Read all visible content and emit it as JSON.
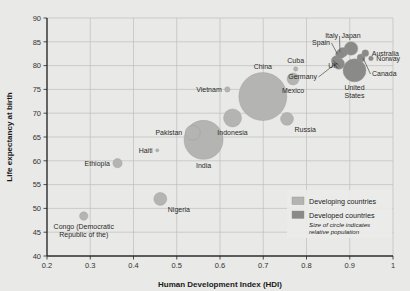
{
  "chart_data": {
    "type": "scatter",
    "title": "",
    "xlabel": "Human Development Index (HDI)",
    "ylabel": "Life expectancy at birth",
    "xlim": [
      0.2,
      1.0
    ],
    "ylim": [
      40,
      90
    ],
    "xticks": [
      "0.2",
      "0.3",
      "0.4",
      "0.5",
      "0.6",
      "0.7",
      "0.8",
      "0.9",
      "1"
    ],
    "yticks": [
      "40",
      "45",
      "50",
      "55",
      "60",
      "65",
      "70",
      "75",
      "80",
      "85",
      "90"
    ],
    "grid": true,
    "bubble_meaning": "Size of circle indicates relative population",
    "legend": {
      "position": "inside-bottom-right",
      "entries": [
        {
          "label": "Developing countries",
          "color": "#b4b4b2"
        },
        {
          "label": "Developed countries",
          "color": "#8a8a88"
        }
      ],
      "note_line1": "Size of circle indicates",
      "note_line2": "relative population"
    },
    "points": [
      {
        "name": "Congo (Democratic Republic of the)",
        "label_lines": [
          "Congo (Democratic",
          "Republic of the)"
        ],
        "x": 0.285,
        "y": 48.4,
        "r": 4.2,
        "group": "Developing countries",
        "label_pos": "below"
      },
      {
        "name": "Ethiopia",
        "label_lines": [
          "Ethiopia"
        ],
        "x": 0.363,
        "y": 59.5,
        "r": 4.6,
        "group": "Developing countries",
        "label_pos": "left"
      },
      {
        "name": "Haiti",
        "label_lines": [
          "Haiti"
        ],
        "x": 0.455,
        "y": 62.2,
        "r": 1.6,
        "group": "Developing countries",
        "label_pos": "left"
      },
      {
        "name": "Nigeria",
        "label_lines": [
          "Nigeria"
        ],
        "x": 0.462,
        "y": 52.0,
        "r": 6.5,
        "group": "Developing countries",
        "label_pos": "below-right"
      },
      {
        "name": "Pakistan",
        "label_lines": [
          "Pakistan"
        ],
        "x": 0.537,
        "y": 65.9,
        "r": 7.5,
        "group": "Developing countries",
        "label_pos": "left"
      },
      {
        "name": "India",
        "label_lines": [
          "India"
        ],
        "x": 0.562,
        "y": 64.4,
        "r": 19.5,
        "group": "Developing countries",
        "label_pos": "below"
      },
      {
        "name": "Indonesia",
        "label_lines": [
          "Indonesia"
        ],
        "x": 0.629,
        "y": 69.0,
        "r": 9.0,
        "group": "Developing countries",
        "label_pos": "below"
      },
      {
        "name": "Vietnam",
        "label_lines": [
          "Vietnam"
        ],
        "x": 0.617,
        "y": 75.0,
        "r": 2.6,
        "group": "Developing countries",
        "label_pos": "left"
      },
      {
        "name": "China",
        "label_lines": [
          "China"
        ],
        "x": 0.699,
        "y": 73.5,
        "r": 24.0,
        "group": "Developing countries",
        "label_pos": "above"
      },
      {
        "name": "Russia",
        "label_lines": [
          "Russia"
        ],
        "x": 0.755,
        "y": 68.8,
        "r": 6.4,
        "group": "Developing countries",
        "label_pos": "below-right"
      },
      {
        "name": "Mexico",
        "label_lines": [
          "Mexico"
        ],
        "x": 0.769,
        "y": 77.2,
        "r": 6.0,
        "group": "Developing countries",
        "label_pos": "below"
      },
      {
        "name": "Cuba",
        "label_lines": [
          "Cuba"
        ],
        "x": 0.775,
        "y": 79.3,
        "r": 2.2,
        "group": "Developing countries",
        "label_pos": "above"
      },
      {
        "name": "Germany",
        "label_lines": [
          "Germany"
        ],
        "x": 0.875,
        "y": 80.4,
        "r": 5.6,
        "group": "Developed countries",
        "label_pos": "leader-left"
      },
      {
        "name": "UK",
        "label_lines": [
          "UK"
        ],
        "x": 0.869,
        "y": 81.0,
        "r": 5.0,
        "group": "Developed countries",
        "label_pos": "leader-left"
      },
      {
        "name": "Spain",
        "label_lines": [
          "Spain"
        ],
        "x": 0.878,
        "y": 82.4,
        "r": 4.6,
        "group": "Developed countries",
        "label_pos": "leader-left"
      },
      {
        "name": "Italy",
        "label_lines": [
          "Italy"
        ],
        "x": 0.884,
        "y": 82.8,
        "r": 4.8,
        "group": "Developed countries",
        "label_pos": "leader-left"
      },
      {
        "name": "Japan",
        "label_lines": [
          "Japan"
        ],
        "x": 0.903,
        "y": 83.6,
        "r": 6.8,
        "group": "Developed countries",
        "label_pos": "above"
      },
      {
        "name": "Australia",
        "label_lines": [
          "Australia"
        ],
        "x": 0.936,
        "y": 82.6,
        "r": 3.4,
        "group": "Developed countries",
        "label_pos": "right"
      },
      {
        "name": "Norway",
        "label_lines": [
          "Norway"
        ],
        "x": 0.949,
        "y": 81.5,
        "r": 2.4,
        "group": "Developed countries",
        "label_pos": "right"
      },
      {
        "name": "Canada",
        "label_lines": [
          "Canada"
        ],
        "x": 0.926,
        "y": 81.6,
        "r": 4.0,
        "group": "Developed countries",
        "label_pos": "leader-right"
      },
      {
        "name": "United States",
        "label_lines": [
          "United",
          "States"
        ],
        "x": 0.911,
        "y": 79.0,
        "r": 11.5,
        "group": "Developed countries",
        "label_pos": "below"
      }
    ]
  }
}
